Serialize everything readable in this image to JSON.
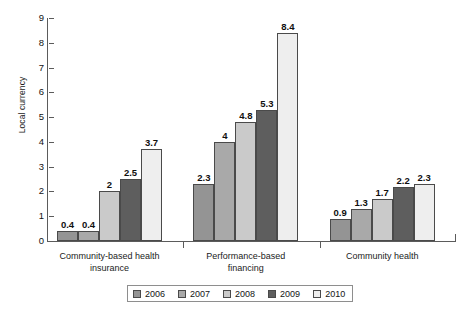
{
  "chart_data": {
    "type": "bar",
    "title": "",
    "subtitle": "",
    "xlabel": "",
    "ylabel": "Local currency",
    "ylim": [
      0,
      9
    ],
    "yticks": [
      0,
      1,
      2,
      3,
      4,
      5,
      6,
      7,
      8,
      9
    ],
    "ytick_labels": [
      "0",
      "1",
      "2",
      "3",
      "4",
      "5",
      "6",
      "7",
      "8",
      "9"
    ],
    "grid": false,
    "legend_position": "bottom",
    "categories": [
      "Community-based health insurance",
      "Performance-based financing",
      "Community health"
    ],
    "category_lines": [
      [
        "Community-based health",
        "insurance"
      ],
      [
        "Performance-based",
        "financing"
      ],
      [
        "Community health",
        ""
      ]
    ],
    "series": [
      {
        "name": "2006",
        "color": "#949494",
        "values": [
          0.4,
          2.3,
          0.9
        ],
        "labels": [
          "0.4",
          "2.3",
          "0.9"
        ]
      },
      {
        "name": "2007",
        "color": "#a9a9a9",
        "values": [
          0.4,
          4.0,
          1.3
        ],
        "labels": [
          "0.4",
          "4",
          "1.3"
        ]
      },
      {
        "name": "2008",
        "color": "#cacaca",
        "values": [
          2.0,
          4.8,
          1.7
        ],
        "labels": [
          "2",
          "4.8",
          "1.7"
        ]
      },
      {
        "name": "2009",
        "color": "#5e5e5e",
        "values": [
          2.5,
          5.3,
          2.2
        ],
        "labels": [
          "2.5",
          "5.3",
          "2.2"
        ]
      },
      {
        "name": "2010",
        "color": "#eeeeee",
        "values": [
          3.7,
          8.4,
          2.3
        ],
        "labels": [
          "3.7",
          "8.4",
          "2.3"
        ]
      }
    ]
  },
  "legend": {
    "entries": [
      {
        "label": "2006",
        "color": "#949494"
      },
      {
        "label": "2007",
        "color": "#a9a9a9"
      },
      {
        "label": "2008",
        "color": "#cacaca"
      },
      {
        "label": "2009",
        "color": "#5e5e5e"
      },
      {
        "label": "2010",
        "color": "#eeeeee"
      }
    ]
  },
  "axis": {
    "y_title": "Local currency",
    "y_ticks": [
      "9",
      "8",
      "7",
      "6",
      "5",
      "4",
      "3",
      "2",
      "1",
      "0"
    ]
  },
  "colors": {
    "axis": "#5b5b5b",
    "bar_outline": "#4a4a4a",
    "text": "#1b1b1b",
    "background": "#ffffff"
  }
}
